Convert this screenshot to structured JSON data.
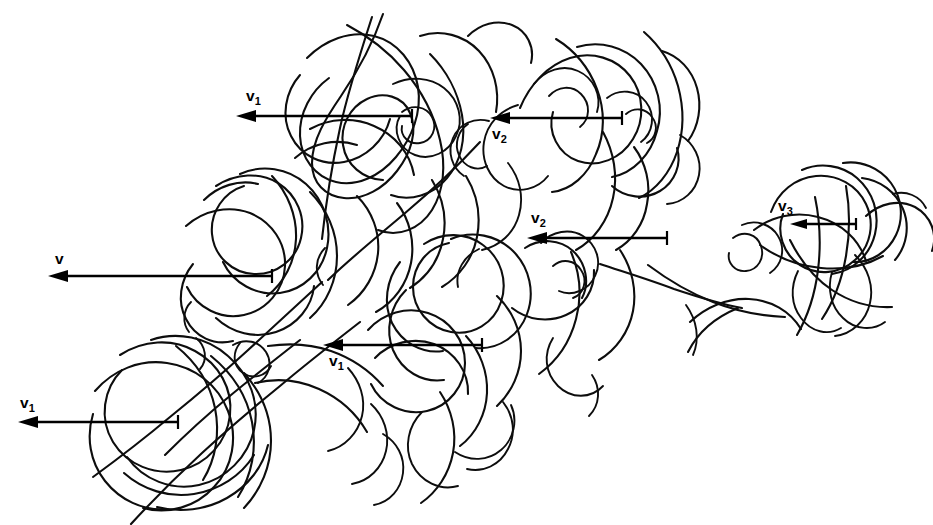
{
  "figure": {
    "kind": "hand-drawn-line-diagram",
    "background_color": "#ffffff",
    "line_color": "#0d0d0d",
    "arrow_color": "#000000",
    "width": 933,
    "height": 525
  },
  "vectors": [
    {
      "id": "v1-top",
      "label_base": "v",
      "label_sub": "1",
      "label_text": "v1",
      "label_x": 246,
      "label_y": 101,
      "label_position": "above-left",
      "direction": "left",
      "head_x": 236,
      "tail_x": 412,
      "y": 116,
      "tail_bar_height": 13
    },
    {
      "id": "v2-top",
      "label_base": "v",
      "label_sub": "2",
      "label_text": "v2",
      "label_x": 492,
      "label_y": 139,
      "label_position": "below-left",
      "direction": "left",
      "head_x": 490,
      "tail_x": 622,
      "y": 118,
      "tail_bar_height": 13
    },
    {
      "id": "v3-right",
      "label_base": "v",
      "label_sub": "3",
      "label_text": "v3",
      "label_x": 778,
      "label_y": 211,
      "label_position": "above-left",
      "direction": "left",
      "head_x": 790,
      "tail_x": 856,
      "y": 224,
      "tail_bar_height": 11
    },
    {
      "id": "v2-middle",
      "label_base": "v",
      "label_sub": "2",
      "label_text": "v2",
      "label_x": 531,
      "label_y": 223,
      "label_position": "above-left",
      "direction": "left",
      "head_x": 527,
      "tail_x": 667,
      "y": 238,
      "tail_bar_height": 13
    },
    {
      "id": "v-plain-left",
      "label_base": "v",
      "label_sub": "",
      "label_text": "v",
      "label_x": 55,
      "label_y": 264,
      "label_position": "above-left",
      "direction": "left",
      "head_x": 48,
      "tail_x": 272,
      "y": 276,
      "tail_bar_height": 13
    },
    {
      "id": "v1-middle",
      "label_base": "v",
      "label_sub": "1",
      "label_text": "v1",
      "label_x": 329,
      "label_y": 366,
      "label_position": "below-left",
      "direction": "left",
      "head_x": 323,
      "tail_x": 482,
      "y": 345,
      "tail_bar_height": 13
    },
    {
      "id": "v1-bottom-left",
      "label_base": "v",
      "label_sub": "1",
      "label_text": "v1",
      "label_x": 20,
      "label_y": 408,
      "label_position": "above-left",
      "direction": "left",
      "head_x": 18,
      "tail_x": 178,
      "y": 422,
      "tail_bar_height": 13
    }
  ]
}
